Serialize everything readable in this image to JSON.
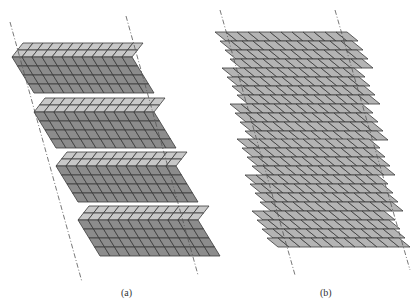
{
  "figure": {
    "panels": [
      {
        "id": "a",
        "caption": "(a)",
        "description": "Zigzag (chevron) folded sheet of parallelogram tiles, four folded bands each with a light upper strip and dark lower strip, bounded by two slanted dashed lines",
        "bands": 4,
        "light_rows_per_band": 2,
        "dark_rows_per_band": 4,
        "columns": 12,
        "colors": {
          "light": "#c8c8c8",
          "dark": "#8c8c8c",
          "stroke": "#3a3a3a"
        },
        "dashed_lines": [
          {
            "x1": 10,
            "y1": 22,
            "x2": 82,
            "y2": 282
          },
          {
            "x1": 126,
            "y1": 16,
            "x2": 198,
            "y2": 275
          }
        ]
      },
      {
        "id": "b",
        "caption": "(b)",
        "description": "Stack of six flat sheared sheets of parallelogram tiles, each offset to the right, bounded by two slanted dashed lines",
        "sheets": 6,
        "rows_per_sheet": 4,
        "columns": 12,
        "colors": {
          "fill": "#b4b4b4",
          "stroke": "#3a3a3a"
        },
        "dashed_lines": [
          {
            "x1": 220,
            "y1": 10,
            "x2": 295,
            "y2": 275
          },
          {
            "x1": 335,
            "y1": 10,
            "x2": 410,
            "y2": 270
          }
        ]
      }
    ]
  }
}
